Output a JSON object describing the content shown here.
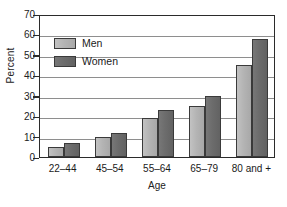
{
  "chart_data": {
    "type": "bar",
    "title": "",
    "subtitle": "",
    "xlabel": "Age",
    "ylabel": "Percent",
    "categories": [
      "22–44",
      "45–54",
      "55–64",
      "65–79",
      "80 and +"
    ],
    "series": [
      {
        "name": "Men",
        "values": [
          5,
          10,
          19,
          25,
          45
        ],
        "color": "#b4b4b4"
      },
      {
        "name": "Women",
        "values": [
          7,
          12,
          23,
          30,
          58
        ],
        "color": "#6c6c6c"
      }
    ],
    "ylim": [
      0,
      70
    ],
    "ytick_values": [
      0,
      10,
      20,
      30,
      40,
      50,
      60,
      70
    ],
    "ytick_labels": [
      "0",
      "10",
      "20",
      "30",
      "40",
      "50",
      "60",
      "70"
    ],
    "grid": true,
    "grid_axis": "y",
    "legend_position": "upper left",
    "legend_frame": false,
    "frame": true
  },
  "legend": {
    "entries": [
      {
        "label": "Men"
      },
      {
        "label": "Women"
      }
    ]
  },
  "axes": {
    "y_label": "Percent",
    "x_label": "Age"
  }
}
